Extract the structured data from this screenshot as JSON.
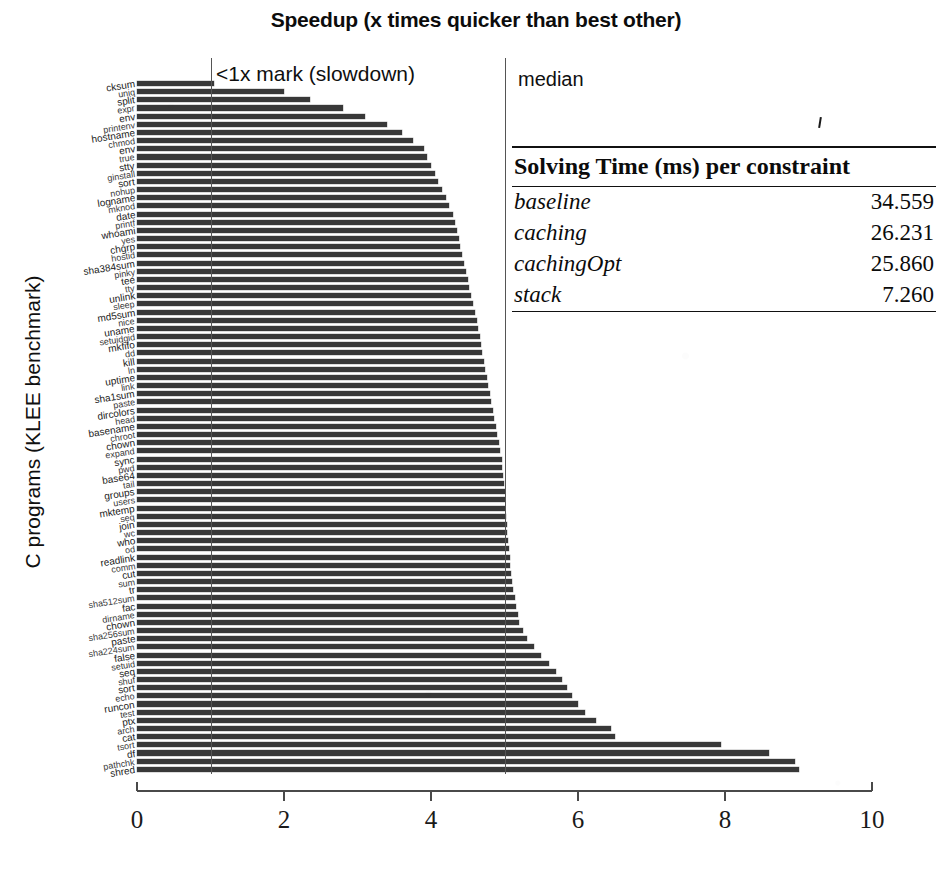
{
  "chart_title": "Speedup (x times quicker than best other)",
  "annotations": {
    "slowdown_mark": "<1x mark (slowdown)",
    "median_mark": "median"
  },
  "axes": {
    "xlabel": "",
    "ylabel": "C programs (KLEE benchmark)",
    "xticks": [
      "0",
      "2",
      "4",
      "6",
      "8",
      "10"
    ]
  },
  "solving_time_table": {
    "header": "Solving Time (ms) per constraint",
    "rows": [
      {
        "name": "baseline",
        "value": "34.559"
      },
      {
        "name": "caching",
        "value": "26.231"
      },
      {
        "name": "cachingOpt",
        "value": "25.860"
      },
      {
        "name": "stack",
        "value": "7.260"
      }
    ]
  },
  "chart_data": {
    "type": "bar",
    "orientation": "horizontal",
    "title": "Speedup (x times quicker than best other)",
    "xlabel": "",
    "ylabel": "C programs (KLEE benchmark)",
    "xlim": [
      0,
      10
    ],
    "xticks": [
      0,
      2,
      4,
      6,
      8,
      10
    ],
    "grid": false,
    "legend": null,
    "reference_lines": [
      {
        "x": 1,
        "label": "<1x mark (slowdown)"
      },
      {
        "x": 5,
        "label": "median"
      }
    ],
    "categories": [
      "cksum",
      "uniq",
      "split",
      "expr",
      "env",
      "printenv",
      "hostname",
      "chmod",
      "env",
      "true",
      "stty",
      "ginstall",
      "sort",
      "nohup",
      "logname",
      "mknod",
      "date",
      "printf",
      "whoami",
      "yes",
      "chgrp",
      "hostid",
      "sha384sum",
      "pinky",
      "tee",
      "tty",
      "unlink",
      "sleep",
      "md5sum",
      "nice",
      "uname",
      "setuidgid",
      "mkfifo",
      "dd",
      "kill",
      "ln",
      "uptime",
      "link",
      "sha1sum",
      "paste",
      "dircolors",
      "head",
      "basename",
      "chroot",
      "chown",
      "expand",
      "sync",
      "pwd",
      "base64",
      "tail",
      "groups",
      "users",
      "mktemp",
      "seq",
      "join",
      "wc",
      "who",
      "od",
      "readlink",
      "comm",
      "cut",
      "sum",
      "tr",
      "sha512sum",
      "fac",
      "dirname",
      "chown2",
      "sha256sum",
      "paste2",
      "sha224sum",
      "false",
      "setuid",
      "seq2",
      "shuf",
      "sort2",
      "echo",
      "runcon",
      "test",
      "ptx",
      "arch",
      "cat",
      "tsort",
      "df",
      "pathchk",
      "shred"
    ],
    "values": [
      1.05,
      2.0,
      2.35,
      2.8,
      3.1,
      3.4,
      3.6,
      3.75,
      3.9,
      3.95,
      4.0,
      4.05,
      4.1,
      4.15,
      4.2,
      4.25,
      4.3,
      4.32,
      4.35,
      4.38,
      4.4,
      4.42,
      4.45,
      4.47,
      4.5,
      4.52,
      4.55,
      4.57,
      4.6,
      4.62,
      4.64,
      4.66,
      4.68,
      4.7,
      4.72,
      4.74,
      4.76,
      4.78,
      4.8,
      4.82,
      4.84,
      4.86,
      4.88,
      4.9,
      4.92,
      4.94,
      4.96,
      4.97,
      4.98,
      4.99,
      5.0,
      5.0,
      5.01,
      5.02,
      5.03,
      5.04,
      5.05,
      5.06,
      5.07,
      5.08,
      5.09,
      5.1,
      5.12,
      5.14,
      5.16,
      5.18,
      5.2,
      5.25,
      5.3,
      5.4,
      5.5,
      5.6,
      5.7,
      5.78,
      5.85,
      5.92,
      6.0,
      6.1,
      6.25,
      6.45,
      6.5,
      7.95,
      8.6,
      8.95,
      9.0
    ],
    "y_tick_labels_visible": [
      "cksum",
      "split",
      "expr",
      "printenv",
      "hostname",
      "chmod",
      "true",
      "ginstall",
      "nohup",
      "logname",
      "mknod",
      "printf",
      "whoami",
      "chgrp",
      "sha384sum",
      "pinky",
      "unlink",
      "md5sum",
      "uname",
      "setuidgid",
      "kill",
      "uptime",
      "sha1sum",
      "dircolors",
      "basename",
      "chown",
      "expand",
      "sync",
      "base64",
      "groups",
      "mktemp",
      "join",
      "readlink",
      "comm",
      "sum",
      "sha512sum",
      "dirname",
      "sha256sum",
      "sha224sum",
      "seq",
      "shuf",
      "runcon",
      "test",
      "arch",
      "tsort",
      "pathchk",
      "shred"
    ]
  }
}
